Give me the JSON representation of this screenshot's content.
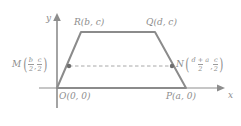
{
  "diagram": {
    "type": "coordinate-geometry-trapezoid",
    "axes": {
      "x_label": "x",
      "y_label": "y",
      "origin_x": 57,
      "origin_y": 88
    },
    "colors": {
      "stroke": "#8d8d8d",
      "shape_stroke": "#8b8b8b",
      "dashed": "#a8a8a8",
      "text": "#8d8d8d",
      "background": "#ffffff"
    },
    "vertices": {
      "O": {
        "label": "O(0, 0)",
        "name": "O",
        "x": 57,
        "y": 88
      },
      "P": {
        "label": "P(a, 0)",
        "name": "P",
        "x": 186,
        "y": 88
      },
      "Q": {
        "label": "Q(d, c)",
        "name": "Q",
        "x": 155,
        "y": 32
      },
      "R": {
        "label": "R(b, c)",
        "name": "R",
        "x": 81,
        "y": 32
      }
    },
    "midpoints": {
      "M": {
        "name": "M",
        "num_x": "b",
        "den_x": "2",
        "num_y": "c",
        "den_y": "2",
        "dot_x": 69,
        "dot_y": 66
      },
      "N": {
        "name": "N",
        "num_x": "d + a",
        "den_x": "2",
        "num_y": "c",
        "den_y": "2",
        "dot_x": 172,
        "dot_y": 66
      }
    }
  }
}
